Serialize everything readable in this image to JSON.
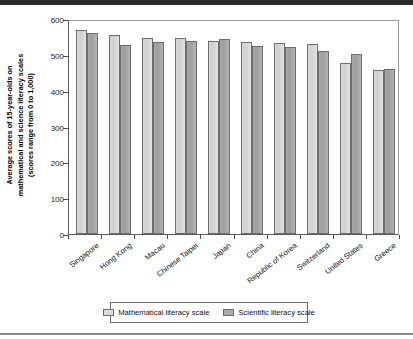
{
  "chart_data": {
    "type": "bar",
    "title": "",
    "subtitle": "",
    "xlabel": "",
    "ylabel": "Average scores of 15-year-olds on mathematical and science literacy scales (scores range from 0 to 1,000)",
    "ylabel_lines": [
      "Average scores of 15-year-olds on",
      "mathematical and science literacy scales",
      "(scores range from 0 to 1,000)"
    ],
    "ylim": [
      0,
      600
    ],
    "yticks": [
      0,
      100,
      200,
      300,
      400,
      500,
      600
    ],
    "ytick_labels": [
      "0",
      "100",
      "200",
      "300",
      "400",
      "500",
      "600"
    ],
    "grid": false,
    "legend_position": "bottom",
    "categories": [
      "Singapore",
      "Hong Kong",
      "Macau",
      "Chinese Taipei",
      "Japan",
      "China",
      "Republic of Korea",
      "Switzerland",
      "United States",
      "Greece"
    ],
    "series": [
      {
        "name": "Mathematical  literacy scale",
        "color": "#dcdcdc",
        "values": [
          570,
          556,
          548,
          547,
          539,
          536,
          532,
          529,
          478,
          459
        ]
      },
      {
        "name": "Scientific literacy scale",
        "color": "#a9a9a9",
        "values": [
          562,
          527,
          535,
          539,
          545,
          525,
          522,
          511,
          502,
          461
        ]
      }
    ]
  },
  "legend": {
    "entries": [
      {
        "label": "Mathematical  literacy scale",
        "swatch": "math-swatch"
      },
      {
        "label": "Scientific literacy scale",
        "swatch": "sci-swatch"
      }
    ]
  }
}
